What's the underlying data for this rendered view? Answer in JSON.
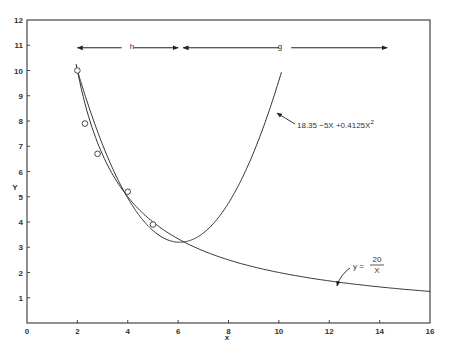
{
  "chart_data": {
    "type": "line",
    "title": "",
    "xlabel": "x",
    "ylabel": "y",
    "xlim": [
      0,
      16
    ],
    "ylim": [
      0,
      12
    ],
    "grid": false,
    "x_ticks": [
      "0",
      "2",
      "4",
      "6",
      "8",
      "10",
      "12",
      "14",
      "16"
    ],
    "y_ticks": [
      "1",
      "2",
      "3",
      "4",
      "5",
      "6",
      "7",
      "8",
      "9",
      "10",
      "11",
      "12"
    ],
    "series": [
      {
        "name": "y = 20/X",
        "kind": "curve",
        "x_range": [
          1.95,
          16
        ],
        "formula": "20/x"
      },
      {
        "name": "18.35 -5X +0.4125X²",
        "kind": "curve",
        "x_range": [
          2.0,
          10.1
        ],
        "formula": "18.35 - 5x + 0.4125x^2"
      },
      {
        "name": "observed",
        "kind": "points",
        "x": [
          2.0,
          2.3,
          2.8,
          4.0,
          5.0
        ],
        "y": [
          10.0,
          7.9,
          6.7,
          5.2,
          3.9
        ]
      }
    ],
    "annotations": [
      {
        "label": "h",
        "type": "double-arrow",
        "x_from": 2.0,
        "x_to": 6.0,
        "y": 10.9
      },
      {
        "label": "g",
        "type": "double-arrow",
        "x_from": 6.2,
        "x_to": 14.3,
        "y": 10.9
      },
      {
        "label": "18.35 -5X +0.4125X²",
        "points_to": "quadratic curve"
      },
      {
        "label": "y = 20 / X",
        "points_to": "hyperbola curve"
      }
    ]
  },
  "labels": {
    "x_axis": "x",
    "y_axis": "Y",
    "h": "h",
    "g": "g",
    "quad_formula": "18.35 −5X +0.4125X",
    "quad_sup": "2",
    "hyper_lhs": "y =",
    "hyper_num": "20",
    "hyper_den": "X"
  }
}
